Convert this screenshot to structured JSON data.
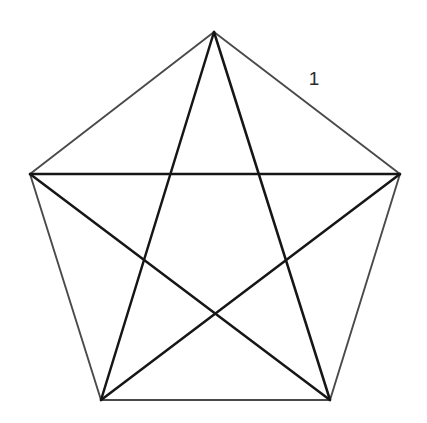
{
  "figure": {
    "name": "regular-pentagon-with-all-diagonals",
    "canvas": {
      "width": 427,
      "height": 423,
      "background": "#ffffff"
    },
    "style": {
      "outline_color": "#4a4a4a",
      "outline_width": 1.9,
      "diagonal_color": "#161616",
      "diagonal_width": 2.5,
      "label_color": "#2b2b2b",
      "label_font_size": 19
    },
    "vertices": [
      {
        "id": "A",
        "name": "top-vertex",
        "x": 214,
        "y": 32
      },
      {
        "id": "B",
        "name": "right-vertex",
        "x": 400,
        "y": 174
      },
      {
        "id": "C",
        "name": "bottom-right-vertex",
        "x": 330,
        "y": 400
      },
      {
        "id": "D",
        "name": "bottom-left-vertex",
        "x": 101,
        "y": 400
      },
      {
        "id": "E",
        "name": "left-vertex",
        "x": 30,
        "y": 174
      }
    ],
    "edges": [
      {
        "id": "AB",
        "name": "edge-top-right",
        "from": "A",
        "to": "B"
      },
      {
        "id": "BC",
        "name": "edge-right",
        "from": "B",
        "to": "C"
      },
      {
        "id": "CD",
        "name": "edge-bottom",
        "from": "C",
        "to": "D"
      },
      {
        "id": "DE",
        "name": "edge-left",
        "from": "D",
        "to": "E"
      },
      {
        "id": "EA",
        "name": "edge-top-left",
        "from": "E",
        "to": "A"
      }
    ],
    "diagonals": [
      {
        "id": "AC",
        "name": "diagonal-top-to-bottom-right",
        "from": "A",
        "to": "C"
      },
      {
        "id": "AD",
        "name": "diagonal-top-to-bottom-left",
        "from": "A",
        "to": "D"
      },
      {
        "id": "BD",
        "name": "diagonal-right-to-bottom-left",
        "from": "B",
        "to": "D"
      },
      {
        "id": "BE",
        "name": "diagonal-right-to-left",
        "from": "B",
        "to": "E"
      },
      {
        "id": "CE",
        "name": "diagonal-bottom-right-to-left",
        "from": "C",
        "to": "E"
      }
    ],
    "labels": [
      {
        "id": "len-AB",
        "name": "side-length-label",
        "text": "1",
        "labels_edge": "AB",
        "x": 314,
        "y": 80
      }
    ]
  }
}
